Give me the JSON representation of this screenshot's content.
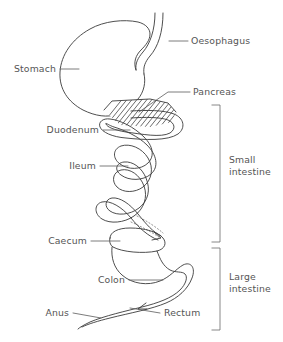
{
  "diagram": {
    "type": "anatomical-line-diagram",
    "background_color": "#ffffff",
    "line_color": "#3a3a3a",
    "text_color": "#555555"
  },
  "labels": {
    "oesophagus": "Oesophagus",
    "stomach": "Stomach",
    "pancreas": "Pancreas",
    "duodenum": "Duodenum",
    "ileum": "Ileum",
    "caecum": "Caecum",
    "colon": "Colon",
    "rectum": "Rectum",
    "anus": "Anus"
  },
  "groups": {
    "small_intestine": {
      "line1": "Small",
      "line2": "intestine"
    },
    "large_intestine": {
      "line1": "Large",
      "line2": "intestine"
    }
  }
}
